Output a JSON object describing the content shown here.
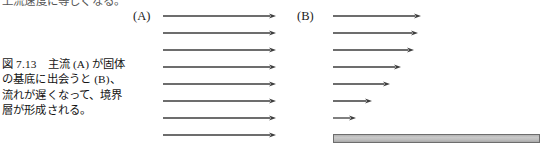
{
  "page": {
    "width": 545,
    "height": 149,
    "background": "#ffffff",
    "ink_color": "#1a1a1a"
  },
  "top_cut_text": "上流速度に等しくなる。",
  "caption": {
    "figure_number": "図 7.13",
    "lines": [
      "図 7.13　主流 (A) が固体",
      "の基底に出会うと (B)、",
      "流れが遅くなって、境界",
      "層が形成される。"
    ],
    "full_text": "図 7.13 主流(A)が固体の基底に出会うと(B)、流れが遅くなって、境界層が形成される。"
  },
  "panels": [
    {
      "id": "A",
      "label": "(A)",
      "label_x": 133,
      "label_y": 9
    },
    {
      "id": "B",
      "label": "(B)",
      "label_x": 297,
      "label_y": 9
    }
  ],
  "chart_data": {
    "type": "diagram",
    "arrow_color": "#3c3c3c",
    "arrow_line_width": 1.3,
    "arrow_head_length": 7,
    "arrow_head_width": 5,
    "panel_A": {
      "label": "(A)",
      "note": "uniform free stream — all arrows equal length",
      "x_start": 163,
      "arrows": [
        {
          "index": 1,
          "y": 16,
          "x_end": 276,
          "length": 113
        },
        {
          "index": 2,
          "y": 33,
          "x_end": 276,
          "length": 113
        },
        {
          "index": 3,
          "y": 50,
          "x_end": 276,
          "length": 113
        },
        {
          "index": 4,
          "y": 67,
          "x_end": 276,
          "length": 113
        },
        {
          "index": 5,
          "y": 84,
          "x_end": 276,
          "length": 113
        },
        {
          "index": 6,
          "y": 101,
          "x_end": 276,
          "length": 113
        },
        {
          "index": 7,
          "y": 118,
          "x_end": 276,
          "length": 113
        },
        {
          "index": 8,
          "y": 135,
          "x_end": 276,
          "length": 113
        }
      ]
    },
    "panel_B": {
      "label": "(B)",
      "note": "boundary layer — arrow length decreases toward the solid plate",
      "x_start": 333,
      "arrows": [
        {
          "index": 1,
          "y": 16,
          "x_end": 421,
          "length": 88
        },
        {
          "index": 2,
          "y": 33,
          "x_end": 418,
          "length": 85
        },
        {
          "index": 3,
          "y": 50,
          "x_end": 414,
          "length": 81
        },
        {
          "index": 4,
          "y": 67,
          "x_end": 401,
          "length": 68
        },
        {
          "index": 5,
          "y": 84,
          "x_end": 390,
          "length": 57
        },
        {
          "index": 6,
          "y": 101,
          "x_end": 372,
          "length": 39
        },
        {
          "index": 7,
          "y": 118,
          "x_end": 356,
          "length": 23
        }
      ],
      "plate": {
        "name": "solid-plate",
        "x": 333,
        "y": 134,
        "width": 207,
        "height": 9,
        "fill": "#c2c2c2",
        "border": "#6d6d6d"
      }
    }
  }
}
